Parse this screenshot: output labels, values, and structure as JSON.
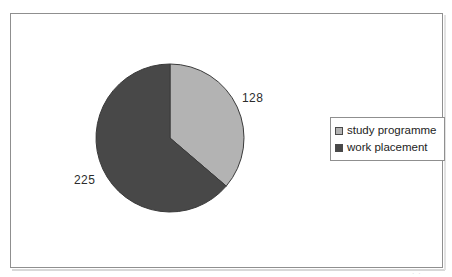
{
  "figure": {
    "frame_border_color": "#8f8f8f",
    "background_color": "#ffffff"
  },
  "labels": {
    "study_value": "128",
    "work_value": "225"
  },
  "legend": {
    "items": [
      {
        "label": "study programme",
        "swatch": "#b3b3b3"
      },
      {
        "label": "work placement",
        "swatch": "#484848"
      }
    ]
  },
  "artifact": {
    "text": "· ·"
  },
  "chart_data": {
    "type": "pie",
    "title": "",
    "subtitle": "",
    "xlabel": "",
    "ylabel": "",
    "categories": [
      "study programme",
      "work placement"
    ],
    "values": [
      128,
      225
    ],
    "value_labels": [
      "128",
      "225"
    ],
    "total": 353,
    "percentages": [
      36.3,
      63.7
    ],
    "colors": [
      "#b3b3b3",
      "#484848"
    ],
    "slice_border_color": "#3a3a3a",
    "start_angle_deg": 0,
    "direction": "clockwise",
    "legend_position": "right",
    "grid": false,
    "annotations": [
      {
        "text": "128",
        "for": "study programme",
        "position": "outside-right"
      },
      {
        "text": "225",
        "for": "work placement",
        "position": "outside-left"
      }
    ]
  }
}
